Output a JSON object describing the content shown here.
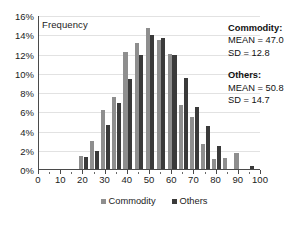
{
  "chart_data": {
    "type": "bar",
    "title": "",
    "subtitle": "",
    "xlabel": "",
    "ylabel": "Frequency",
    "ylim": [
      0,
      16
    ],
    "xlim": [
      0,
      100
    ],
    "grid": true,
    "legend_position": "bottom",
    "y_tick_labels": [
      "16%",
      "14%",
      "12%",
      "10%",
      "8%",
      "6%",
      "4%",
      "2%",
      "0%"
    ],
    "y_tick_values": [
      16,
      14,
      12,
      10,
      8,
      6,
      4,
      2,
      0
    ],
    "x_tick_labels": [
      "0",
      "10",
      "20",
      "30",
      "40",
      "50",
      "60",
      "70",
      "80",
      "90",
      "100"
    ],
    "x_tick_values": [
      0,
      10,
      20,
      30,
      40,
      50,
      60,
      70,
      80,
      90,
      100
    ],
    "categories": [
      20,
      25,
      30,
      35,
      40,
      45,
      50,
      55,
      60,
      65,
      70,
      75,
      80,
      85,
      90,
      95
    ],
    "series": [
      {
        "name": "Commodity",
        "color": "#8e8e8e",
        "values": [
          1.4,
          2.9,
          6.1,
          7.5,
          12.2,
          13.1,
          14.7,
          13.4,
          12.0,
          6.7,
          5.4,
          2.6,
          1.0,
          1.1,
          1.65,
          0.0
        ]
      },
      {
        "name": "Others",
        "color": "#3a3a3a",
        "values": [
          1.25,
          1.85,
          4.6,
          6.85,
          9.35,
          11.8,
          13.9,
          13.6,
          11.85,
          9.5,
          6.45,
          4.5,
          2.4,
          0.0,
          0.0,
          0.3
        ]
      }
    ],
    "annotations": [
      {
        "title": "Commodity:",
        "lines": [
          "MEAN = 47.0",
          "SD = 12.8"
        ]
      },
      {
        "title": "Others:",
        "lines": [
          "MEAN = 50.8",
          "SD = 14.7"
        ]
      }
    ],
    "legend_entries": [
      "Commodity",
      "Others"
    ]
  }
}
